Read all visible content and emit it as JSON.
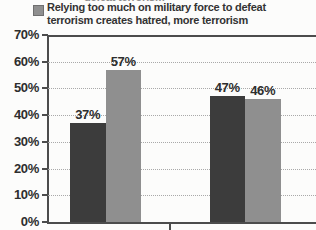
{
  "page": {
    "background": "#fcfcfb"
  },
  "top_cropped_text": "defeat terrorism",
  "legend": {
    "swatch_color": "#8f8f8f",
    "label": "Relying too much on military force to defeat terrorism creates hatred, more terrorism"
  },
  "chart_data": {
    "type": "bar",
    "categories": [
      "",
      ""
    ],
    "series": [
      {
        "name": "",
        "color": "#3c3c3c",
        "values": [
          37,
          47
        ]
      },
      {
        "name": "Relying too much on military force to defeat terrorism creates hatred, more terrorism",
        "color": "#8f8f8f",
        "values": [
          57,
          46
        ]
      }
    ],
    "data_labels": [
      [
        "37%",
        "57%"
      ],
      [
        "47%",
        "46%"
      ]
    ],
    "y_ticks": [
      "70%",
      "60%",
      "50%",
      "40%",
      "30%",
      "20%",
      "10%",
      "0%"
    ],
    "ylim": [
      0,
      70
    ],
    "grid": "dotted-horizontal",
    "legend_position": "top",
    "colors": {
      "axis": "#4c4c4c",
      "gridline": "#a9a9a9",
      "label_text": "#2e2e2e"
    }
  }
}
